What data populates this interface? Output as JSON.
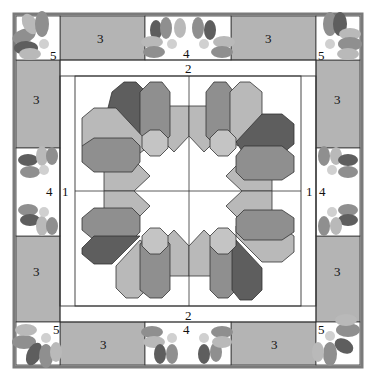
{
  "diagram": {
    "colors": {
      "outer_border": "#7a7a7a",
      "block_fill": "#b4b4b4",
      "petal_light": "#b9b9b9",
      "petal_mid": "#8f8f8f",
      "petal_dark": "#5e5e5e",
      "center_octagon": "#c4c4c4",
      "line": "#333333",
      "background": "#ffffff"
    },
    "labels": {
      "center_left": "1",
      "center_right": "1",
      "sashing_top": "2",
      "sashing_bottom": "2",
      "border_plain_top_left": "3",
      "border_plain_top_right": "3",
      "border_plain_left_top": "3",
      "border_plain_left_bottom": "3",
      "border_plain_right_top": "3",
      "border_plain_right_bottom": "3",
      "border_plain_bottom_left": "3",
      "border_plain_bottom_right": "3",
      "border_flower_top": "4",
      "border_flower_bottom": "4",
      "border_flower_left": "4",
      "border_flower_right": "4",
      "corner_top_left": "5",
      "corner_top_right": "5",
      "corner_bottom_left": "5",
      "corner_bottom_right": "5"
    }
  }
}
